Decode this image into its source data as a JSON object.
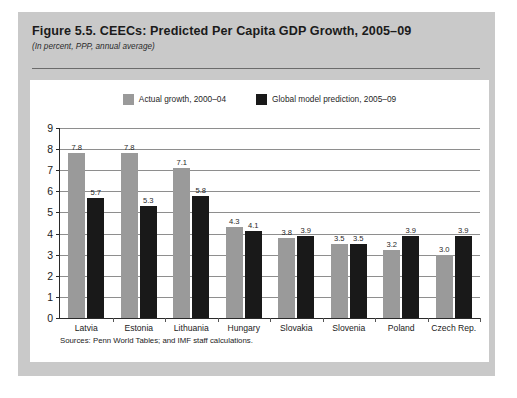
{
  "figure": {
    "title": "Figure 5.5. CEECs:  Predicted Per Capita GDP Growth, 2005–09",
    "subtitle": "(In percent, PPP, annual average)",
    "source_note": "Sources: Penn World Tables; and IMF staff calculations."
  },
  "colors": {
    "card_background": "#c9c9c9",
    "panel_background": "#ffffff",
    "series_actual": "#9a9a9a",
    "series_prediction": "#191919",
    "gridline": "#8e8e8e",
    "axis": "#2a2a2a",
    "text": "#1b1b1b"
  },
  "chart_data": {
    "type": "bar",
    "title": "Figure 5.5. CEECs:  Predicted Per Capita GDP Growth, 2005–09",
    "subtitle": "(In percent, PPP, annual average)",
    "xlabel": "",
    "ylabel": "",
    "ylim": [
      0,
      9
    ],
    "yticks": [
      0,
      1,
      2,
      3,
      4,
      5,
      6,
      7,
      8,
      9
    ],
    "ytick_labels": [
      "0",
      "1",
      "2",
      "3",
      "4",
      "5",
      "6",
      "7",
      "8",
      "9"
    ],
    "grid": true,
    "legend_position": "top-center",
    "categories": [
      "Latvia",
      "Estonia",
      "Lithuania",
      "Hungary",
      "Slovakia",
      "Slovenia",
      "Poland",
      "Czech Rep."
    ],
    "series": [
      {
        "name": "Actual growth, 2000–04",
        "color": "#9a9a9a",
        "values": [
          7.8,
          7.8,
          7.1,
          4.3,
          3.8,
          3.5,
          3.2,
          3.0
        ],
        "labels": [
          "7.8",
          "7.8",
          "7.1",
          "4.3",
          "3.8",
          "3.5",
          "3.2",
          "3.0"
        ]
      },
      {
        "name": "Global model prediction, 2005–09",
        "color": "#191919",
        "values": [
          5.7,
          5.3,
          5.8,
          4.1,
          3.9,
          3.5,
          3.9,
          3.9
        ],
        "labels": [
          "5.7",
          "5.3",
          "5.8",
          "4.1",
          "3.9",
          "3.5",
          "3.9",
          "3.9"
        ]
      }
    ]
  }
}
